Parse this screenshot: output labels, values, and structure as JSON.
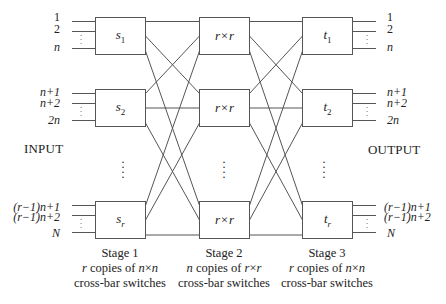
{
  "diagram": {
    "side_labels": {
      "input": "INPUT",
      "output": "OUTPUT"
    },
    "stage1": {
      "boxes": [
        {
          "name": "s",
          "sub": "1"
        },
        {
          "name": "s",
          "sub": "2"
        },
        {
          "name": "s",
          "sub": "r"
        }
      ],
      "caption": {
        "title": "Stage 1",
        "line2": "r copies of n×n",
        "line3": "cross-bar switches"
      }
    },
    "stage2": {
      "boxes": [
        {
          "label": "r×r"
        },
        {
          "label": "r×r"
        },
        {
          "label": "r×r"
        }
      ],
      "caption": {
        "title": "Stage 2",
        "line2": "n copies of r×r",
        "line3": "cross-bar switches"
      }
    },
    "stage3": {
      "boxes": [
        {
          "name": "t",
          "sub": "1"
        },
        {
          "name": "t",
          "sub": "2"
        },
        {
          "name": "t",
          "sub": "r"
        }
      ],
      "caption": {
        "title": "Stage 3",
        "line2": "r copies of n×n",
        "line3": "cross-bar switches"
      }
    },
    "port_labels": {
      "group1": [
        "1",
        "2",
        "n"
      ],
      "group2": [
        "n+1",
        "n+2",
        "2n"
      ],
      "groupr": [
        "(r−1)n+1",
        "(r−1)n+2",
        "N"
      ]
    },
    "ellipsis": "⋮",
    "colors": {
      "line": "#555555",
      "text": "#222222",
      "background": "#ffffff"
    }
  }
}
